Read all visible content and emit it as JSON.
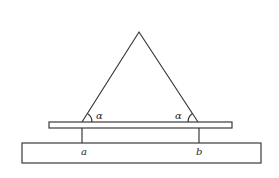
{
  "diagram": {
    "type": "mechanics-figure",
    "labels": {
      "angle_left": "α",
      "angle_right": "α",
      "support_a": "a",
      "support_b": "b"
    },
    "colors": {
      "stroke": "#3a3a3a",
      "background": "#ffffff"
    }
  }
}
